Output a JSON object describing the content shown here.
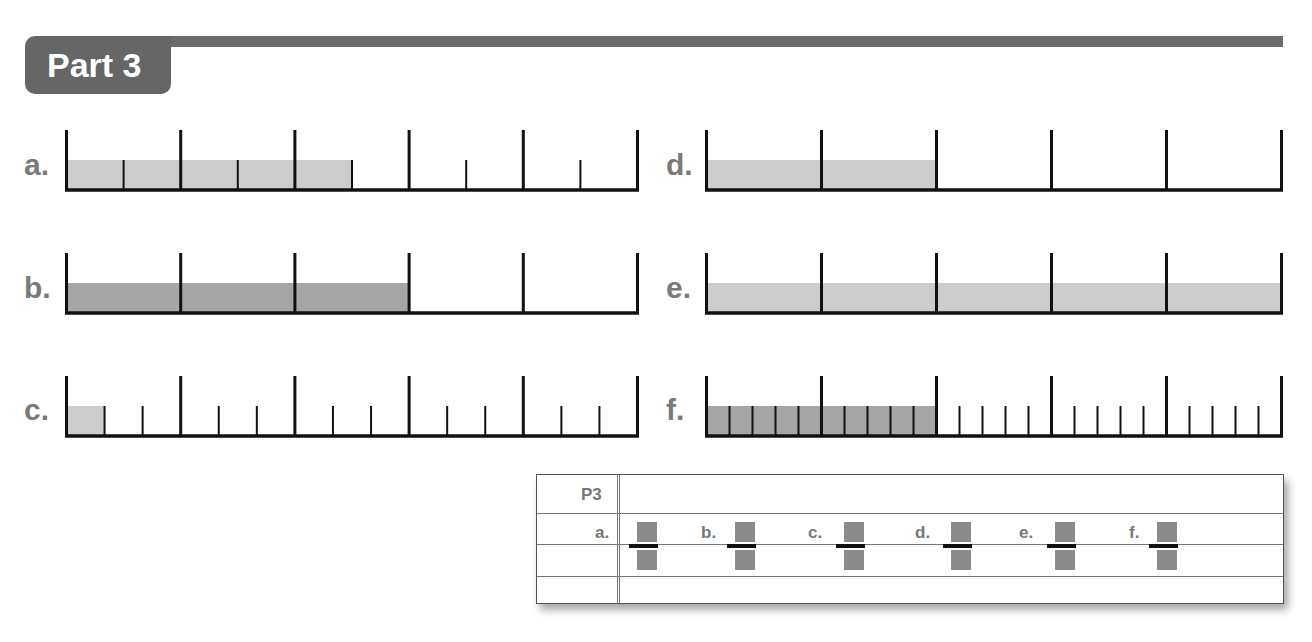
{
  "header": {
    "title": "Part 3"
  },
  "colors": {
    "header": "#666666",
    "fill_light": "#cccccc",
    "fill_dark": "#a6a6a6",
    "line": "#111111",
    "answer_box": "#8a8a8a"
  },
  "chart_data": [
    {
      "type": "bar",
      "id": "a",
      "label": "a.",
      "units": 5,
      "parts_per_unit": 2,
      "total_parts": 10,
      "shaded_parts": 5,
      "shade": "light"
    },
    {
      "type": "bar",
      "id": "b",
      "label": "b.",
      "units": 5,
      "parts_per_unit": 1,
      "total_parts": 5,
      "shaded_parts": 3,
      "shade": "dark"
    },
    {
      "type": "bar",
      "id": "c",
      "label": "c.",
      "units": 5,
      "parts_per_unit": 3,
      "total_parts": 15,
      "shaded_parts": 1,
      "shade": "light"
    },
    {
      "type": "bar",
      "id": "d",
      "label": "d.",
      "units": 5,
      "parts_per_unit": 1,
      "total_parts": 5,
      "shaded_parts": 2,
      "shade": "light"
    },
    {
      "type": "bar",
      "id": "e",
      "label": "e.",
      "units": 5,
      "parts_per_unit": 1,
      "total_parts": 5,
      "shaded_parts": 5,
      "shade": "light"
    },
    {
      "type": "bar",
      "id": "f",
      "label": "f.",
      "units": 5,
      "parts_per_unit": 5,
      "total_parts": 25,
      "shaded_parts": 10,
      "shade": "dark"
    }
  ],
  "answer_box": {
    "title": "P3",
    "items": [
      {
        "label": "a."
      },
      {
        "label": "b."
      },
      {
        "label": "c."
      },
      {
        "label": "d."
      },
      {
        "label": "e."
      },
      {
        "label": "f."
      }
    ]
  }
}
